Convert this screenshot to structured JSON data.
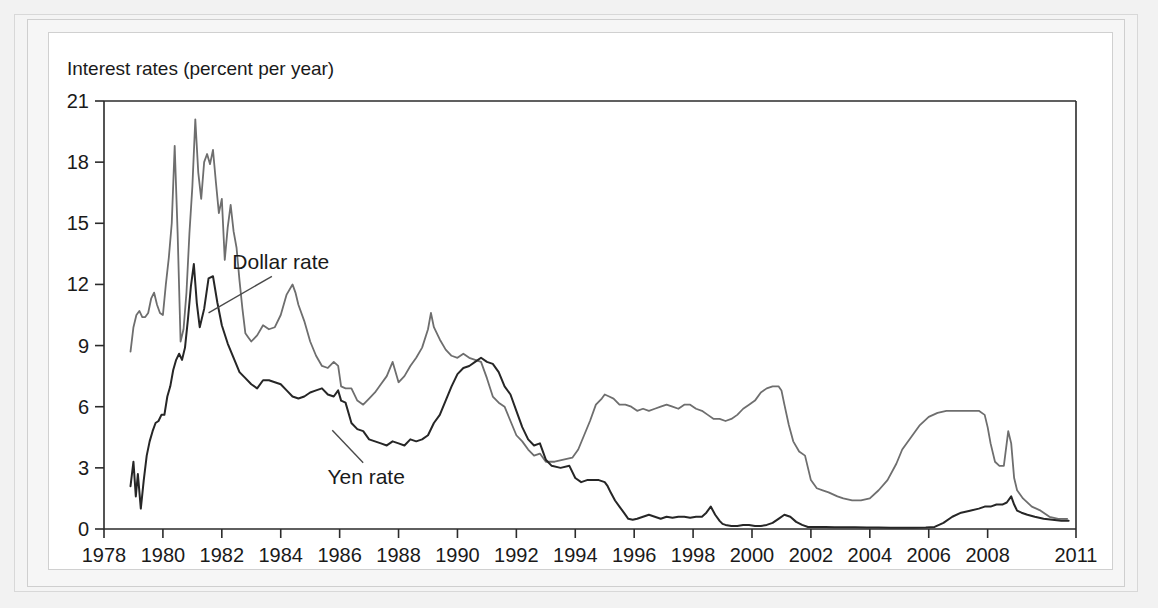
{
  "figure": {
    "caption_title": "Interest rates (percent per year)"
  },
  "chart_data": {
    "type": "line",
    "title": "Interest rates (percent per year)",
    "xlabel": "",
    "ylabel": "Interest rates (percent per year)",
    "xlim": [
      1978.0,
      2011.0
    ],
    "ylim": [
      0,
      21
    ],
    "yticks": [
      0,
      3,
      6,
      9,
      12,
      15,
      18,
      21
    ],
    "ytick_labels": [
      "0",
      "3",
      "6",
      "9",
      "12",
      "15",
      "18",
      "21"
    ],
    "xticks": [
      1978,
      1980,
      1982,
      1984,
      1986,
      1988,
      1990,
      1992,
      1994,
      1996,
      1998,
      2000,
      2002,
      2004,
      2006,
      2008,
      2011
    ],
    "xtick_labels": [
      "1978",
      "1980",
      "1982",
      "1984",
      "1986",
      "1988",
      "1990",
      "1992",
      "1994",
      "1996",
      "1998",
      "2000",
      "2002",
      "2004",
      "2006",
      "2008",
      "2011"
    ],
    "grid": false,
    "legend_position": "inline-annotations",
    "annotations": [
      {
        "name": "dollar-rate-annotation",
        "text": "Dollar rate",
        "text_x": 1984.0,
        "text_y": 13.1,
        "leader_from_x": 1983.7,
        "leader_from_y": 12.4,
        "leader_to_x": 1981.55,
        "leader_to_y": 10.6
      },
      {
        "name": "yen-rate-annotation",
        "text": "Yen rate",
        "text_x": 1986.9,
        "text_y": 2.55,
        "leader_from_x": 1986.8,
        "leader_from_y": 3.25,
        "leader_to_x": 1985.75,
        "leader_to_y": 4.85
      }
    ],
    "series": [
      {
        "name": "Dollar rate",
        "color": "#6e6e6e",
        "line_width": 1.8,
        "x": [
          1978.9,
          1979.0,
          1979.1,
          1979.2,
          1979.3,
          1979.4,
          1979.5,
          1979.6,
          1979.7,
          1979.8,
          1979.9,
          1980.0,
          1980.1,
          1980.2,
          1980.3,
          1980.4,
          1980.5,
          1980.6,
          1980.7,
          1980.8,
          1980.9,
          1981.0,
          1981.1,
          1981.2,
          1981.3,
          1981.4,
          1981.5,
          1981.6,
          1981.7,
          1981.8,
          1981.9,
          1982.0,
          1982.1,
          1982.2,
          1982.3,
          1982.4,
          1982.5,
          1982.6,
          1982.7,
          1982.8,
          1982.9,
          1983.0,
          1983.2,
          1983.4,
          1983.6,
          1983.8,
          1984.0,
          1984.2,
          1984.4,
          1984.5,
          1984.6,
          1984.8,
          1985.0,
          1985.2,
          1985.4,
          1985.6,
          1985.8,
          1985.95,
          1986.05,
          1986.2,
          1986.4,
          1986.6,
          1986.8,
          1987.0,
          1987.2,
          1987.4,
          1987.6,
          1987.8,
          1988.0,
          1988.2,
          1988.4,
          1988.6,
          1988.8,
          1989.0,
          1989.1,
          1989.2,
          1989.4,
          1989.6,
          1989.8,
          1990.0,
          1990.2,
          1990.4,
          1990.6,
          1990.8,
          1991.0,
          1991.2,
          1991.4,
          1991.6,
          1991.8,
          1992.0,
          1992.2,
          1992.4,
          1992.6,
          1992.8,
          1993.0,
          1993.3,
          1993.6,
          1993.9,
          1994.1,
          1994.3,
          1994.5,
          1994.7,
          1994.9,
          1995.0,
          1995.15,
          1995.3,
          1995.5,
          1995.7,
          1995.9,
          1996.1,
          1996.3,
          1996.5,
          1996.7,
          1996.9,
          1997.1,
          1997.3,
          1997.5,
          1997.7,
          1997.9,
          1998.1,
          1998.3,
          1998.5,
          1998.7,
          1998.9,
          1999.1,
          1999.3,
          1999.5,
          1999.7,
          1999.9,
          2000.1,
          2000.3,
          2000.5,
          2000.7,
          2000.9,
          2001.0,
          2001.1,
          2001.25,
          2001.4,
          2001.6,
          2001.8,
          2002.0,
          2002.2,
          2002.4,
          2002.6,
          2002.9,
          2003.1,
          2003.4,
          2003.7,
          2004.0,
          2004.3,
          2004.6,
          2004.9,
          2005.1,
          2005.4,
          2005.7,
          2006.0,
          2006.3,
          2006.6,
          2006.9,
          2007.2,
          2007.5,
          2007.7,
          2007.9,
          2008.0,
          2008.1,
          2008.25,
          2008.4,
          2008.55,
          2008.7,
          2008.8,
          2008.9,
          2009.0,
          2009.2,
          2009.5,
          2009.8,
          2010.1,
          2010.4,
          2010.7
        ],
        "y": [
          8.7,
          9.9,
          10.5,
          10.7,
          10.4,
          10.4,
          10.6,
          11.3,
          11.6,
          11.0,
          10.6,
          10.5,
          12.0,
          13.3,
          15.0,
          18.8,
          14.5,
          9.2,
          9.8,
          11.6,
          14.5,
          16.8,
          20.1,
          17.5,
          16.2,
          18.0,
          18.4,
          17.9,
          18.6,
          17.0,
          15.5,
          16.2,
          13.2,
          14.8,
          15.9,
          14.6,
          13.8,
          12.2,
          10.8,
          9.6,
          9.4,
          9.2,
          9.5,
          10.0,
          9.8,
          9.9,
          10.5,
          11.5,
          12.0,
          11.6,
          11.0,
          10.2,
          9.2,
          8.5,
          8.0,
          7.9,
          8.2,
          8.0,
          7.0,
          6.9,
          6.9,
          6.3,
          6.1,
          6.4,
          6.7,
          7.1,
          7.5,
          8.2,
          7.2,
          7.5,
          8.0,
          8.4,
          8.9,
          9.8,
          10.6,
          9.9,
          9.3,
          8.8,
          8.5,
          8.4,
          8.6,
          8.4,
          8.3,
          8.2,
          7.4,
          6.5,
          6.2,
          6.0,
          5.3,
          4.6,
          4.3,
          3.9,
          3.6,
          3.7,
          3.3,
          3.3,
          3.4,
          3.5,
          3.9,
          4.6,
          5.3,
          6.1,
          6.4,
          6.6,
          6.5,
          6.4,
          6.1,
          6.1,
          6.0,
          5.8,
          5.9,
          5.8,
          5.9,
          6.0,
          6.1,
          6.0,
          5.9,
          6.1,
          6.1,
          5.9,
          5.8,
          5.6,
          5.4,
          5.4,
          5.3,
          5.4,
          5.6,
          5.9,
          6.1,
          6.3,
          6.7,
          6.9,
          7.0,
          7.0,
          6.8,
          6.1,
          5.1,
          4.3,
          3.8,
          3.6,
          2.4,
          2.0,
          1.9,
          1.8,
          1.6,
          1.5,
          1.4,
          1.4,
          1.5,
          1.9,
          2.4,
          3.2,
          3.9,
          4.5,
          5.1,
          5.5,
          5.7,
          5.8,
          5.8,
          5.8,
          5.8,
          5.8,
          5.6,
          5.0,
          4.2,
          3.3,
          3.1,
          3.1,
          4.8,
          4.2,
          2.5,
          1.9,
          1.5,
          1.1,
          0.9,
          0.6,
          0.5,
          0.5
        ],
        "peak_value": 20.1,
        "peak_year": 1981.1,
        "end_value": 0.5
      },
      {
        "name": "Yen rate",
        "color": "#262626",
        "line_width": 2.0,
        "x": [
          1978.9,
          1979.0,
          1979.08,
          1979.15,
          1979.25,
          1979.35,
          1979.45,
          1979.55,
          1979.65,
          1979.75,
          1979.85,
          1979.95,
          1980.05,
          1980.15,
          1980.25,
          1980.35,
          1980.45,
          1980.55,
          1980.65,
          1980.75,
          1980.85,
          1980.95,
          1981.05,
          1981.15,
          1981.25,
          1981.4,
          1981.55,
          1981.7,
          1981.85,
          1982.0,
          1982.2,
          1982.4,
          1982.6,
          1982.8,
          1983.0,
          1983.2,
          1983.4,
          1983.6,
          1983.8,
          1984.0,
          1984.2,
          1984.4,
          1984.6,
          1984.8,
          1985.0,
          1985.2,
          1985.4,
          1985.6,
          1985.8,
          1985.95,
          1986.05,
          1986.2,
          1986.4,
          1986.6,
          1986.8,
          1987.0,
          1987.2,
          1987.4,
          1987.6,
          1987.8,
          1988.0,
          1988.2,
          1988.4,
          1988.6,
          1988.8,
          1989.0,
          1989.2,
          1989.4,
          1989.6,
          1989.8,
          1990.0,
          1990.2,
          1990.4,
          1990.6,
          1990.8,
          1991.0,
          1991.2,
          1991.4,
          1991.6,
          1991.8,
          1992.0,
          1992.2,
          1992.4,
          1992.6,
          1992.8,
          1993.0,
          1993.2,
          1993.5,
          1993.8,
          1994.0,
          1994.2,
          1994.4,
          1994.6,
          1994.8,
          1995.0,
          1995.1,
          1995.2,
          1995.35,
          1995.5,
          1995.65,
          1995.8,
          1995.95,
          1996.1,
          1996.3,
          1996.5,
          1996.7,
          1996.9,
          1997.1,
          1997.3,
          1997.5,
          1997.7,
          1997.9,
          1998.1,
          1998.3,
          1998.45,
          1998.6,
          1998.75,
          1998.9,
          1999.0,
          1999.1,
          1999.3,
          1999.5,
          1999.7,
          1999.9,
          2000.1,
          2000.3,
          2000.5,
          2000.7,
          2000.9,
          2001.1,
          2001.3,
          2001.5,
          2001.7,
          2001.9,
          2002.2,
          2002.5,
          2002.8,
          2003.1,
          2003.5,
          2003.9,
          2004.3,
          2004.7,
          2005.1,
          2005.5,
          2005.9,
          2006.2,
          2006.5,
          2006.8,
          2007.1,
          2007.4,
          2007.7,
          2007.9,
          2008.1,
          2008.3,
          2008.5,
          2008.65,
          2008.8,
          2008.9,
          2009.0,
          2009.15,
          2009.35,
          2009.6,
          2009.9,
          2010.2,
          2010.5,
          2010.75
        ],
        "y": [
          2.1,
          3.3,
          1.6,
          2.7,
          1.0,
          2.4,
          3.6,
          4.3,
          4.8,
          5.2,
          5.3,
          5.6,
          5.6,
          6.5,
          7.0,
          7.8,
          8.3,
          8.6,
          8.3,
          8.9,
          10.3,
          11.9,
          13.0,
          11.1,
          9.9,
          10.8,
          12.3,
          12.4,
          11.1,
          10.0,
          9.1,
          8.4,
          7.7,
          7.4,
          7.1,
          6.9,
          7.3,
          7.3,
          7.2,
          7.1,
          6.8,
          6.5,
          6.4,
          6.5,
          6.7,
          6.8,
          6.9,
          6.6,
          6.5,
          6.8,
          6.3,
          6.2,
          5.2,
          4.9,
          4.8,
          4.4,
          4.3,
          4.2,
          4.1,
          4.3,
          4.2,
          4.1,
          4.4,
          4.3,
          4.4,
          4.6,
          5.2,
          5.6,
          6.3,
          7.0,
          7.6,
          7.9,
          8.0,
          8.2,
          8.4,
          8.2,
          8.1,
          7.7,
          7.0,
          6.6,
          5.8,
          5.0,
          4.4,
          4.1,
          4.2,
          3.4,
          3.1,
          3.0,
          3.1,
          2.5,
          2.3,
          2.4,
          2.4,
          2.4,
          2.3,
          2.1,
          1.8,
          1.4,
          1.1,
          0.8,
          0.5,
          0.45,
          0.5,
          0.6,
          0.7,
          0.6,
          0.5,
          0.6,
          0.55,
          0.6,
          0.6,
          0.55,
          0.6,
          0.6,
          0.8,
          1.1,
          0.7,
          0.4,
          0.25,
          0.2,
          0.15,
          0.15,
          0.2,
          0.2,
          0.15,
          0.15,
          0.2,
          0.3,
          0.5,
          0.7,
          0.6,
          0.35,
          0.2,
          0.1,
          0.1,
          0.1,
          0.08,
          0.08,
          0.08,
          0.07,
          0.07,
          0.06,
          0.06,
          0.06,
          0.07,
          0.1,
          0.3,
          0.6,
          0.8,
          0.9,
          1.0,
          1.1,
          1.1,
          1.2,
          1.2,
          1.3,
          1.6,
          1.2,
          0.9,
          0.8,
          0.7,
          0.6,
          0.5,
          0.45,
          0.4,
          0.4
        ],
        "peak_value": 13.0,
        "peak_year": 1981.05,
        "end_value": 0.4
      }
    ]
  }
}
